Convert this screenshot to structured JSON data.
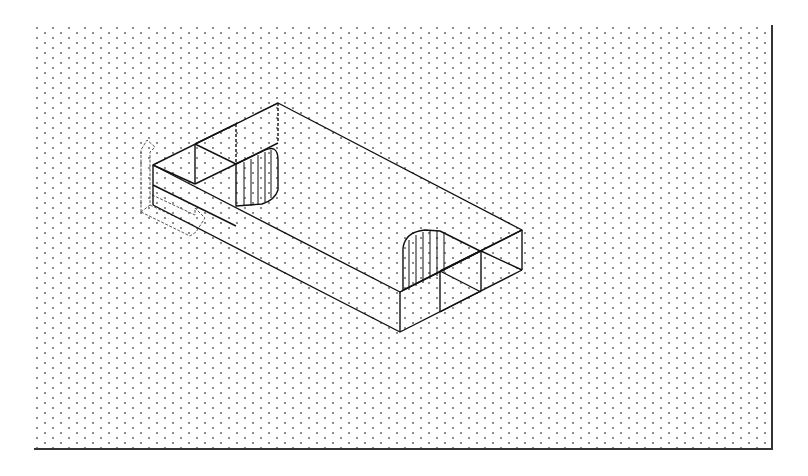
{
  "drawing": {
    "type": "isometric CAD wireframe",
    "background": "#ffffff",
    "grid": {
      "style": "isometric dots",
      "spacing_x": 8,
      "spacing_y": 10,
      "color": "#555555"
    },
    "frame": {
      "left": 35,
      "top": 25,
      "right": 772,
      "bottom": 449,
      "color": "#333333"
    },
    "line_color": "#111111",
    "object": {
      "name": "rectangular block with two semicircular slots",
      "top_face": [
        [
          153,
          165
        ],
        [
          278,
          103
        ],
        [
          522,
          230
        ],
        [
          400,
          292
        ]
      ],
      "height": 40
    },
    "ucs_icon": {
      "name": "ucs-icon",
      "axes": [
        "X",
        "Y"
      ]
    }
  }
}
